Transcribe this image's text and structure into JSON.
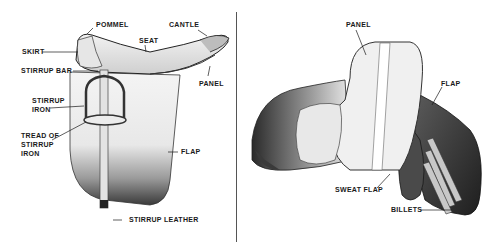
{
  "diagram": {
    "left_panel": {
      "subject": "side view of English saddle",
      "labels": {
        "pommel": "POMMEL",
        "cantle": "CANTLE",
        "seat": "SEAT",
        "skirt": "SKIRT",
        "stirrup_bar": "STIRRUP BAR",
        "panel": "PANEL",
        "stirrup_iron_1": "STIRRUP",
        "stirrup_iron_2": "IRON",
        "tread_1": "TREAD OF",
        "tread_2": "STIRRUP",
        "tread_3": "IRON",
        "flap": "FLAP",
        "stirrup_leather": "STIRRUP LEATHER"
      }
    },
    "right_panel": {
      "subject": "underside view of English saddle",
      "labels": {
        "panel": "PANEL",
        "flap": "FLAP",
        "sweat_flap": "SWEAT FLAP",
        "billets": "BILLETS"
      }
    },
    "colors": {
      "ink": "#1a1a1a",
      "shade_dark": "#2a2a2a",
      "shade_mid": "#8a8a8a",
      "paper": "#ffffff"
    }
  }
}
